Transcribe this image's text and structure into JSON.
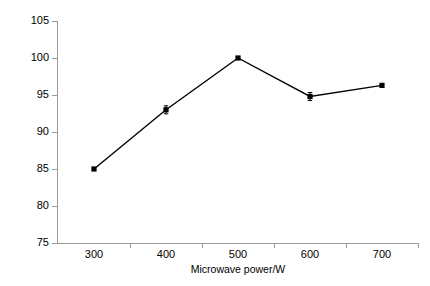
{
  "chart_data": {
    "type": "line",
    "title": "",
    "subtitle": "",
    "xlabel": "Microwave power/W",
    "ylabel": "Sterilization rate/%",
    "x": [
      300,
      400,
      500,
      600,
      700
    ],
    "values": [
      85.0,
      93.0,
      100.0,
      94.8,
      96.3
    ],
    "series": [
      {
        "name": "Sterilization rate",
        "values": [
          85.0,
          93.0,
          100.0,
          94.8,
          96.3
        ],
        "color": "#000000",
        "marker": "square",
        "line_style": "solid"
      }
    ],
    "error_bars": {
      "present": true,
      "note": "small vertical error bars at 400 W and 600 W"
    },
    "xlim": [
      250,
      750
    ],
    "ylim": [
      75,
      105
    ],
    "xticks": [
      300,
      400,
      500,
      600,
      700
    ],
    "yticks": [
      75,
      80,
      85,
      90,
      95,
      100,
      105
    ],
    "xtick_labels": [
      "300",
      "400",
      "500",
      "600",
      "700"
    ],
    "ytick_labels": [
      "75",
      "80",
      "85",
      "90",
      "95",
      "100",
      "105"
    ],
    "grid": false,
    "legend": false,
    "legend_position": "none",
    "axis_color": "#9a9a9a",
    "background": "#ffffff",
    "minor_xticks": [
      350,
      450,
      550,
      650,
      750
    ]
  },
  "axes": {
    "y_title": "Sterilization rate/%",
    "x_title": "Microwave power/W"
  }
}
